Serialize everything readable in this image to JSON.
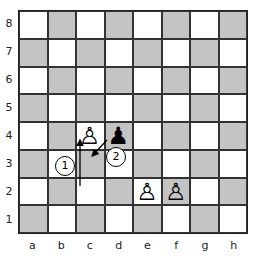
{
  "diagram": {
    "type": "chess-board",
    "files": [
      "a",
      "b",
      "c",
      "d",
      "e",
      "f",
      "g",
      "h"
    ],
    "ranks": [
      "8",
      "7",
      "6",
      "5",
      "4",
      "3",
      "2",
      "1"
    ],
    "colors": {
      "light_square": "#ffffff",
      "dark_square": "#c4c4c4",
      "border": "#222222"
    },
    "pieces": [
      {
        "square": "c4",
        "piece": "white-pawn",
        "glyph": "♙"
      },
      {
        "square": "d4",
        "piece": "black-pawn",
        "glyph": "♟"
      },
      {
        "square": "e2",
        "piece": "white-pawn",
        "glyph": "♙"
      },
      {
        "square": "f2",
        "piece": "white-pawn",
        "glyph": "♙"
      }
    ],
    "arrows": [
      {
        "id": "1",
        "from": "c2",
        "to": "c4",
        "label": "1"
      },
      {
        "id": "2",
        "from": "d4",
        "to": "c3",
        "label": "2"
      }
    ]
  }
}
